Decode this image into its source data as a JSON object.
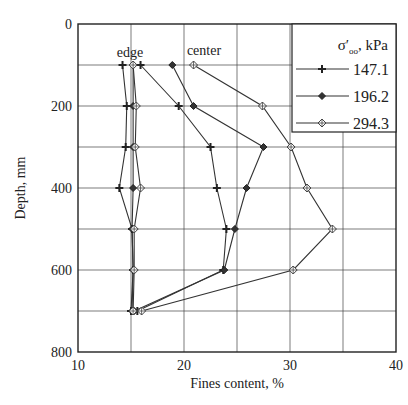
{
  "chart_data": {
    "type": "line",
    "title": "",
    "xlabel": "Fines content, %",
    "ylabel": "Depth, mm",
    "xlim": [
      10,
      40
    ],
    "ylim": [
      800,
      0
    ],
    "y_inverted": true,
    "x_ticks": [
      10,
      20,
      30,
      40
    ],
    "y_ticks": [
      0,
      200,
      400,
      600,
      800
    ],
    "grid": true,
    "grid_x_step": 5,
    "grid_y_step": 100,
    "legend": {
      "title": "σ'₀₀, kPa",
      "position": "upper right",
      "entries": [
        "147.1",
        "196.2",
        "294.3"
      ]
    },
    "annotations": [
      {
        "text": "edge",
        "x": 14.7,
        "y": 70
      },
      {
        "text": "center",
        "x": 21.5,
        "y": 65
      }
    ],
    "depth": [
      100,
      200,
      300,
      400,
      500,
      600,
      700
    ],
    "series": [
      {
        "name": "147.1",
        "location": "edge",
        "marker": "plus",
        "x": [
          14.2,
          14.6,
          14.5,
          13.9,
          15.1,
          15.2,
          15.0
        ],
        "y": [
          100,
          200,
          300,
          400,
          500,
          600,
          700
        ]
      },
      {
        "name": "147.1",
        "location": "center",
        "marker": "plus",
        "x": [
          15.9,
          19.5,
          22.5,
          23.1,
          24.0,
          23.7,
          15.6
        ],
        "y": [
          100,
          200,
          300,
          400,
          500,
          600,
          700
        ]
      },
      {
        "name": "196.2",
        "location": "edge",
        "marker": "diamond",
        "x": [
          15.2,
          15.2,
          15.2,
          15.2,
          15.1,
          15.2,
          15.1
        ],
        "y": [
          100,
          200,
          300,
          400,
          500,
          600,
          700
        ]
      },
      {
        "name": "196.2",
        "location": "center",
        "marker": "diamond",
        "x": [
          18.9,
          20.9,
          27.5,
          25.9,
          24.8,
          23.8,
          15.3
        ],
        "y": [
          100,
          200,
          300,
          400,
          500,
          600,
          700
        ]
      },
      {
        "name": "294.3",
        "location": "edge",
        "marker": "crossed-diamond",
        "x": [
          15.2,
          15.5,
          15.4,
          15.9,
          15.3,
          15.3,
          15.2
        ],
        "y": [
          100,
          200,
          300,
          400,
          500,
          600,
          700
        ]
      },
      {
        "name": "294.3",
        "location": "center",
        "marker": "crossed-diamond",
        "x": [
          20.9,
          27.4,
          30.1,
          31.6,
          34.0,
          30.3,
          16.0
        ],
        "y": [
          100,
          200,
          300,
          400,
          500,
          600,
          700
        ]
      }
    ]
  },
  "colors": {
    "line": "#333333",
    "grid": "#444444",
    "axis": "#222222"
  }
}
